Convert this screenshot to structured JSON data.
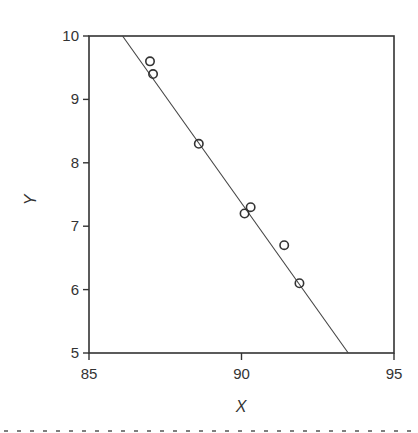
{
  "chart_data": {
    "type": "scatter",
    "title": "",
    "xlabel": "X",
    "ylabel": "Y",
    "xlim": [
      85,
      95
    ],
    "ylim": [
      5,
      10
    ],
    "xticks": [
      85,
      90,
      95
    ],
    "yticks": [
      5,
      6,
      7,
      8,
      9,
      10
    ],
    "xtick_labels": [
      "85",
      "90",
      "95"
    ],
    "ytick_labels": [
      "5",
      "6",
      "7",
      "8",
      "9",
      "10"
    ],
    "grid": false,
    "legend": null,
    "series": [
      {
        "name": "observations",
        "marker": "open-circle",
        "x": [
          87.0,
          87.1,
          88.6,
          90.1,
          90.3,
          91.4,
          91.9
        ],
        "y": [
          9.6,
          9.4,
          8.3,
          7.2,
          7.3,
          6.7,
          6.1
        ]
      }
    ],
    "fit_line": {
      "name": "regression line",
      "x": [
        86.1,
        93.5
      ],
      "y": [
        10,
        5
      ]
    },
    "colors": {
      "axis": "#333333",
      "marker": "#333333",
      "line": "#444444",
      "separator": "#555555"
    }
  }
}
